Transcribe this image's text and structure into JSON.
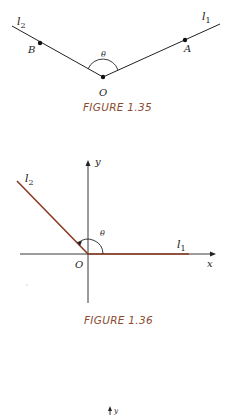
{
  "figures": [
    {
      "caption": "FIGURE 1.35",
      "labels": {
        "l1": "l",
        "l1_sub": "1",
        "l2": "l",
        "l2_sub": "2",
        "A": "A",
        "B": "B",
        "O": "O",
        "theta": "θ"
      }
    },
    {
      "caption": "FIGURE 1.36",
      "labels": {
        "l1": "l",
        "l1_sub": "1",
        "l2": "l",
        "l2_sub": "2",
        "O": "O",
        "theta": "θ",
        "x": "x",
        "y": "y"
      }
    },
    {
      "caption": "",
      "labels": {
        "y": "y"
      }
    }
  ],
  "colors": {
    "line": "#222222",
    "accent_line": "#8b3a22",
    "caption": "#8a4a2e"
  }
}
